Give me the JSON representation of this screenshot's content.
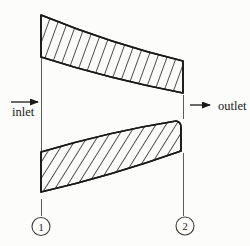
{
  "figure": {
    "type": "converging-nozzle-section-diagram",
    "inlet_label": "inlet",
    "outlet_label": "outlet",
    "stations": [
      {
        "label": "1"
      },
      {
        "label": "2"
      }
    ]
  },
  "colors": {
    "ink": "#1a1a1a",
    "thin_line": "#4a4a4a",
    "background": "#fcfcfa"
  }
}
